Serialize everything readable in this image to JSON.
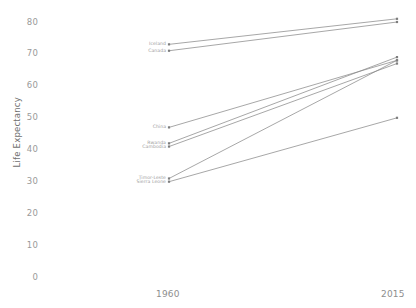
{
  "chart_data": {
    "type": "line",
    "subtype": "slope-chart",
    "title": "",
    "subtitle": "",
    "xlabel": "",
    "ylabel": "Life Expectancy",
    "x": [
      1960,
      2015
    ],
    "xtick_labels": [
      "1960",
      "2015"
    ],
    "ytick_labels": [
      "0",
      "10",
      "20",
      "30",
      "40",
      "50",
      "60",
      "70",
      "80"
    ],
    "yticks": [
      0,
      10,
      20,
      30,
      40,
      50,
      60,
      70,
      80
    ],
    "ylim": [
      0,
      84
    ],
    "grid": false,
    "legend": "none",
    "label_position": "left-endpoint",
    "line_color": "#8a8a8a",
    "series": [
      {
        "name": "Iceland",
        "values": [
          73,
          81
        ]
      },
      {
        "name": "Canada",
        "values": [
          71,
          80
        ]
      },
      {
        "name": "China",
        "values": [
          47,
          68
        ]
      },
      {
        "name": "Rwanda",
        "values": [
          42,
          69
        ]
      },
      {
        "name": "Cambodia",
        "values": [
          41,
          67
        ]
      },
      {
        "name": "Timor-Leste",
        "values": [
          31,
          68
        ]
      },
      {
        "name": "Sierra Leone",
        "values": [
          30,
          50
        ]
      }
    ]
  }
}
